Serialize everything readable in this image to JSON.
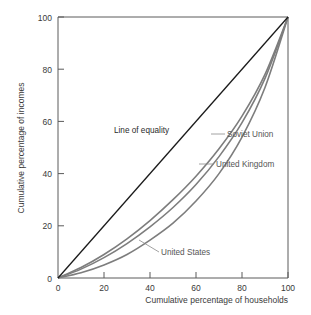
{
  "chart_data": {
    "type": "line",
    "title": "",
    "xlabel": "Cumulative percentage of households",
    "ylabel": "Cumulative percentage of incomes",
    "xlim": [
      0,
      100
    ],
    "ylim": [
      0,
      100
    ],
    "xticks": [
      "0",
      "20",
      "40",
      "60",
      "80",
      "100"
    ],
    "yticks": [
      "0",
      "20",
      "40",
      "60",
      "80",
      "100"
    ],
    "grid": false,
    "legend_position": "inline-annotations",
    "annotations": [
      {
        "text": "Line of equality"
      },
      {
        "text": "Soviet Union"
      },
      {
        "text": "United Kingdom"
      },
      {
        "text": "United States"
      }
    ],
    "series": [
      {
        "name": "Line of equality",
        "color": "#1a1a1a",
        "x": [
          0,
          100
        ],
        "values": [
          0,
          100
        ]
      },
      {
        "name": "Soviet Union",
        "color": "#7d7d7d",
        "x": [
          0,
          10,
          20,
          30,
          40,
          50,
          60,
          70,
          80,
          90,
          100
        ],
        "values": [
          0,
          4.0,
          9.0,
          15.0,
          22.0,
          30.0,
          39.0,
          49.5,
          62.0,
          78.0,
          100
        ]
      },
      {
        "name": "United Kingdom",
        "color": "#7d7d7d",
        "x": [
          0,
          10,
          20,
          30,
          40,
          50,
          60,
          70,
          80,
          90,
          100
        ],
        "values": [
          0,
          3.4,
          7.8,
          13.2,
          19.6,
          27.0,
          35.8,
          46.5,
          59.5,
          76.5,
          100
        ]
      },
      {
        "name": "United States",
        "color": "#7d7d7d",
        "x": [
          0,
          10,
          20,
          30,
          40,
          50,
          60,
          70,
          80,
          90,
          100
        ],
        "values": [
          0,
          2.0,
          5.0,
          9.0,
          14.5,
          21.0,
          29.5,
          40.0,
          54.0,
          73.0,
          100
        ]
      }
    ]
  },
  "axes": {
    "x_title": "Cumulative percentage of households",
    "y_title": "Cumulative percentage of incomes",
    "x_tick_labels": [
      "0",
      "20",
      "40",
      "60",
      "80",
      "100"
    ],
    "y_tick_labels": [
      "0",
      "20",
      "40",
      "60",
      "80",
      "100"
    ]
  },
  "labels": {
    "equality": "Line of equality",
    "soviet_union": "Soviet Union",
    "united_kingdom": "United Kingdom",
    "united_states": "United States"
  },
  "colors": {
    "equality_line": "#1a1a1a",
    "curve_line": "#7d7d7d",
    "axis": "#5a5a5a",
    "text": "#3a3a3a",
    "label_text": "#555555",
    "background": "#ffffff"
  }
}
